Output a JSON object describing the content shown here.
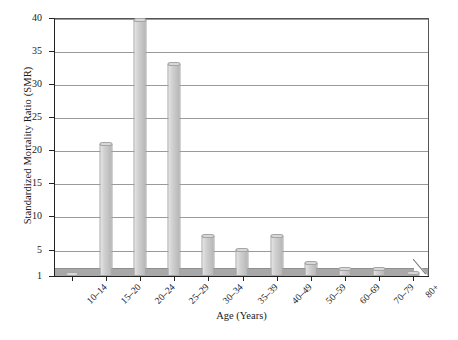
{
  "chart_data": {
    "type": "bar",
    "title": "",
    "xlabel": "Age (Years)",
    "ylabel": "Standardized Mortality Ratio (SMR)",
    "categories": [
      "10–14",
      "15–20",
      "20–24",
      "25–29",
      "30–34",
      "35–39",
      "40–49",
      "50–59",
      "60–69",
      "70–79",
      "80+"
    ],
    "values": [
      1.3,
      21.0,
      39.7,
      33.0,
      7.0,
      5.0,
      7.1,
      3.0,
      2.1,
      2.0,
      1.4
    ],
    "ylim": [
      1,
      40
    ],
    "yticks": [
      1,
      5,
      10,
      15,
      20,
      25,
      30,
      35,
      40
    ],
    "ytick_labels": [
      "1",
      "5",
      "10",
      "15",
      "20",
      "25",
      "30",
      "35",
      "40"
    ],
    "grid": true,
    "legend": "none",
    "style": "3d-bars-with-floor",
    "bar_color": "#c8c8c8",
    "floor_color": "#a8a8a8",
    "gridline_color": "#9a9a9a",
    "axis_color": "#222222",
    "floor_top_value": 2.0
  },
  "caption": ""
}
